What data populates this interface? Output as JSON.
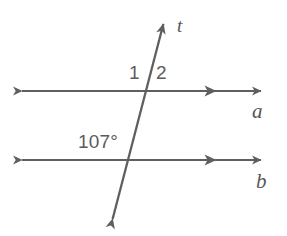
{
  "figure": {
    "kind": "geometry-diagram",
    "width": 287,
    "height": 236,
    "background_color": "#ffffff",
    "stroke_color": "#5f5f5f",
    "label_color": "#5c5c5c"
  },
  "lines": [
    {
      "id": "line-a",
      "label": "a",
      "label_x": 252,
      "label_y": 101,
      "orientation": "horizontal",
      "y": 91,
      "x_start": 13,
      "x_end": 270,
      "arrow_start": true,
      "arrow_end": true,
      "parallel_mark_x": 215
    },
    {
      "id": "line-b",
      "label": "b",
      "label_x": 256,
      "label_y": 171,
      "orientation": "horizontal",
      "y": 160,
      "x_start": 13,
      "x_end": 270,
      "arrow_start": true,
      "arrow_end": true,
      "parallel_mark_x": 215
    },
    {
      "id": "line-t",
      "label": "t",
      "label_x": 177,
      "label_y": 16,
      "orientation": "transversal",
      "x_top": 166,
      "y_top": 14,
      "x_bottom": 110,
      "y_bottom": 229,
      "arrow_start": true,
      "arrow_end": true
    }
  ],
  "intersections": [
    {
      "id": "intersection-a",
      "x": 147,
      "y": 91
    },
    {
      "id": "intersection-b",
      "x": 128,
      "y": 160
    }
  ],
  "angles": [
    {
      "id": "angle-1",
      "label": "1",
      "label_x": 129,
      "label_y": 63,
      "at_intersection": "intersection-a",
      "position": "upper-left"
    },
    {
      "id": "angle-2",
      "label": "2",
      "label_x": 156,
      "label_y": 63,
      "at_intersection": "intersection-a",
      "position": "upper-right"
    },
    {
      "id": "angle-107",
      "label": "107°",
      "label_x": 78,
      "label_y": 132,
      "at_intersection": "intersection-b",
      "position": "upper-left"
    }
  ]
}
